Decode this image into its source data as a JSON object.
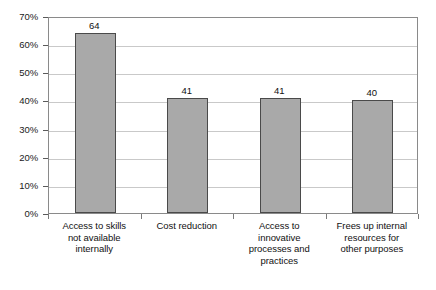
{
  "chart_data": {
    "type": "bar",
    "title": "",
    "subtitle": "",
    "xlabel": "",
    "ylabel": "",
    "categories": [
      "Access to skills\nnot available\ninternally",
      "Cost reduction",
      "Access to\ninnovative\nprocesses and\npractices",
      "Frees up internal\nresources for\nother purposes"
    ],
    "values": [
      64,
      41,
      41,
      40
    ],
    "data_labels": [
      "64",
      "41",
      "41",
      "40"
    ],
    "ylim": [
      0,
      70
    ],
    "ytick_values": [
      0,
      10,
      20,
      30,
      40,
      50,
      60,
      70
    ],
    "ytick_labels": [
      "0%",
      "10%",
      "20%",
      "30%",
      "40%",
      "50%",
      "60%",
      "70%"
    ],
    "grid": "horizontal",
    "legend": "none",
    "series": [
      {
        "name": "",
        "values": [
          64,
          41,
          41,
          40
        ]
      }
    ],
    "colors": {
      "bar_fill": "#a9a9a9",
      "bar_border": "#4a4a4a",
      "gridline": "#c9c9c9",
      "plot_border": "#8a8a8a",
      "text": "#111111",
      "background": "#ffffff"
    }
  }
}
